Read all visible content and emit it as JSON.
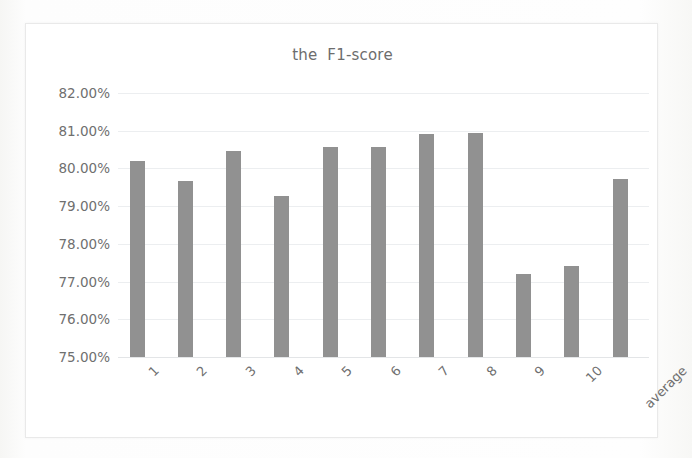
{
  "chart_data": {
    "type": "bar",
    "title": "the  F1-score",
    "xlabel": "",
    "ylabel": "",
    "categories": [
      "1",
      "2",
      "3",
      "4",
      "5",
      "6",
      "7",
      "8",
      "9",
      "10",
      "average"
    ],
    "values": [
      80.21,
      79.67,
      80.45,
      79.27,
      80.56,
      80.56,
      80.92,
      80.95,
      77.21,
      77.42,
      79.72
    ],
    "value_labels": [
      "80.21%",
      "79.67%",
      "80.45%",
      "79.27%",
      "80.56%",
      "80.56%",
      "80.92%",
      "80.95%",
      "77.21%",
      "77.42%",
      "79.72%"
    ],
    "ylim": [
      75.0,
      82.0
    ],
    "ytick_labels": [
      "82.00%",
      "81.00%",
      "80.00%",
      "79.00%",
      "78.00%",
      "77.00%",
      "76.00%",
      "75.00%"
    ],
    "ytick_values": [
      82.0,
      81.0,
      80.0,
      79.0,
      78.0,
      77.0,
      76.0,
      75.0
    ],
    "grid": true,
    "legend": false,
    "legend_position": "none",
    "series": [
      {
        "name": "F1-score",
        "values": [
          80.21,
          79.67,
          80.45,
          79.27,
          80.56,
          80.56,
          80.92,
          80.95,
          77.21,
          77.42,
          79.72
        ]
      }
    ],
    "colors": {
      "bar": "#919191",
      "gridline": "#eceef0",
      "axis_text": "#6f6f6f",
      "title_text": "#6d6d6d",
      "frame_border": "#e9e9e9",
      "plot_background": "#ffffff",
      "page_background": "#fdfdfd"
    }
  }
}
